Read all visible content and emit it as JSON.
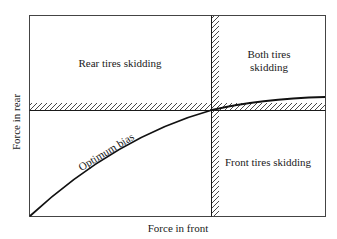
{
  "diagram": {
    "type": "brake-bias-regions",
    "axes": {
      "x_label": "Force in front",
      "y_label": "Force in rear"
    },
    "regions": {
      "top_left": "Rear tires skidding",
      "top_right_line1": "Both tires",
      "top_right_line2": "skidding",
      "bottom_right": "Front tires skidding"
    },
    "curve": {
      "label": "Optimum bias"
    },
    "colors": {
      "line": "#1a1a1a",
      "hatch": "#333333",
      "background": "#ffffff"
    }
  }
}
